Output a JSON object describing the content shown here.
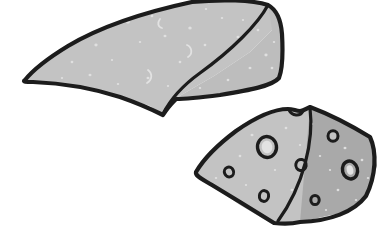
{
  "image": {
    "title": "Two cheese wedges line-art illustration",
    "width": 391,
    "height": 248,
    "background_color": "#ffffff",
    "style": "hand-drawn black outline clipart with flat gray fills and speckle texture"
  },
  "palette": {
    "background": "#ffffff",
    "outline": "#1c1c1c",
    "face_light": "#c3c3c3",
    "face_mid": "#bdbdbd",
    "face_dark": "#a9a9a9",
    "speckle_light": "#e2e2e2",
    "hole_fill": "#cccccc",
    "hole_outline": "#1c1c1c"
  },
  "objects": [
    {
      "id": "cheese-wedge-large",
      "label": "Large cheese wedge (no holes)",
      "faces": [
        {
          "id": "top-slope",
          "label": "Top sloping face",
          "fill": "#c3c3c3",
          "points": "25,80 40,63 68,46 110,26 150,11 192,2 237,0 268,4 277,12 272,30 250,52 214,76 176,98 163,114 150,106 120,96 82,88 48,83"
        },
        {
          "id": "right-face",
          "label": "Right end face",
          "fill": "#bdbdbd",
          "points": "268,4 277,12 281,28 283,50 282,70 277,80 262,86 235,92 205,97 180,99 176,98 214,76 250,52 272,30"
        }
      ],
      "crease": {
        "id": "wedge-crease",
        "label": "Front ridge crease line",
        "path": "M 268,5 C 258,24 232,50 200,73 C 182,86 170,100 163,114"
      },
      "outline_path": "M 25,80 C 33,70 50,57 68,46 C 105,24 150,11 192,2 C 222,-1 252,0 268,5 C 277,10 281,20 282,34 C 283,52 283,68 279,78 C 272,86 250,90 220,95 C 196,98 178,99 176,99 C 170,105 166,110 163,115 C 157,112 143,105 120,97 C 92,88 58,83 33,82 C 26,82 22,82 25,80 Z",
      "speckles": [
        {
          "cx": 128,
          "cy": 22,
          "r": 1.6
        },
        {
          "cx": 152,
          "cy": 16,
          "r": 1.2
        },
        {
          "cx": 165,
          "cy": 36,
          "r": 1.3
        },
        {
          "cx": 140,
          "cy": 42,
          "r": 1.1
        },
        {
          "cx": 96,
          "cy": 45,
          "r": 1.4
        },
        {
          "cx": 72,
          "cy": 62,
          "r": 1.2
        },
        {
          "cx": 90,
          "cy": 75,
          "r": 1.3
        },
        {
          "cx": 112,
          "cy": 60,
          "r": 1.0
        },
        {
          "cx": 190,
          "cy": 28,
          "r": 1.5
        },
        {
          "cx": 205,
          "cy": 45,
          "r": 1.2
        },
        {
          "cx": 222,
          "cy": 18,
          "r": 1.1
        },
        {
          "cx": 238,
          "cy": 37,
          "r": 1.3
        },
        {
          "cx": 180,
          "cy": 62,
          "r": 1.2
        },
        {
          "cx": 148,
          "cy": 78,
          "r": 1.3
        },
        {
          "cx": 118,
          "cy": 84,
          "r": 1.1
        },
        {
          "cx": 62,
          "cy": 78,
          "r": 1.0
        },
        {
          "cx": 258,
          "cy": 30,
          "r": 1.2
        },
        {
          "cx": 266,
          "cy": 55,
          "r": 1.4
        },
        {
          "cx": 274,
          "cy": 42,
          "r": 1.1
        },
        {
          "cx": 250,
          "cy": 68,
          "r": 1.3
        },
        {
          "cx": 228,
          "cy": 80,
          "r": 1.2
        },
        {
          "cx": 200,
          "cy": 88,
          "r": 1.1
        },
        {
          "cx": 243,
          "cy": 20,
          "r": 1.0
        },
        {
          "cx": 272,
          "cy": 68,
          "r": 1.2
        },
        {
          "cx": 206,
          "cy": 9,
          "r": 1.1
        },
        {
          "cx": 168,
          "cy": 86,
          "r": 1.0
        }
      ],
      "squiggles": [
        {
          "id": "squiggle-a",
          "path": "M 160,19 C 157,23 158,27 162,28"
        },
        {
          "id": "squiggle-b",
          "path": "M 187,45 C 192,47 193,54 188,57"
        },
        {
          "id": "squiggle-c",
          "path": "M 148,70 C 153,74 152,80 147,83"
        }
      ]
    },
    {
      "id": "cheese-wedge-holed",
      "label": "Small cheese wedge with holes",
      "faces": [
        {
          "id": "top-face",
          "label": "Top / front face with holes",
          "fill": "#c3c3c3",
          "points": "196,172 206,158 232,134 262,117 286,109 294,112 302,110 310,107 372,138 300,222 272,224 240,205 212,186"
        },
        {
          "id": "right-face",
          "label": "Shaded right cut face",
          "fill": "#a9a9a9",
          "points": "310,107 372,138 377,166 368,194 345,212 300,222"
        }
      ],
      "crease": {
        "id": "holed-wedge-crease",
        "label": "Ridge line from apex to bottom corner",
        "path": "M 310,108 C 314,140 304,185 278,221"
      },
      "outline_path": "M 196,172 C 203,160 216,146 236,131 C 256,117 275,109 288,109 C 293,109 296,111 300,111 C 304,111 307,108 310,107 C 326,113 352,126 370,137 C 377,152 376,176 366,196 C 354,212 330,221 300,222 C 292,224 282,224 274,223 C 258,213 230,196 212,185 C 202,179 195,176 196,172 Z",
      "notch": {
        "id": "top-notch",
        "label": "Small bite notch on top edge",
        "path": "M 289,110 C 292,116 300,117 303,111"
      },
      "holes": [
        {
          "id": "hole-large-left",
          "cx": 267,
          "cy": 147,
          "rx": 9.5,
          "ry": 10.5,
          "rot": -8,
          "face": "top"
        },
        {
          "id": "hole-small-upper-right",
          "cx": 333,
          "cy": 136,
          "rx": 5.0,
          "ry": 5.2,
          "rot": 0,
          "face": "top"
        },
        {
          "id": "hole-small-mid",
          "cx": 301,
          "cy": 165,
          "rx": 5.2,
          "ry": 5.5,
          "rot": 10,
          "face": "top"
        },
        {
          "id": "hole-small-left",
          "cx": 229,
          "cy": 172,
          "rx": 4.6,
          "ry": 5.0,
          "rot": -20,
          "face": "top"
        },
        {
          "id": "hole-small-bottom-left",
          "cx": 264,
          "cy": 196,
          "rx": 4.6,
          "ry": 5.4,
          "rot": 8,
          "face": "top"
        },
        {
          "id": "hole-large-right-face",
          "cx": 350,
          "cy": 170,
          "rx": 7.5,
          "ry": 9.0,
          "rot": -14,
          "face": "right"
        },
        {
          "id": "hole-small-bottom-right-face",
          "cx": 315,
          "cy": 200,
          "rx": 4.2,
          "ry": 4.6,
          "rot": 0,
          "face": "right"
        }
      ],
      "speckles": [
        {
          "cx": 252,
          "cy": 135,
          "r": 1.3
        },
        {
          "cx": 286,
          "cy": 128,
          "r": 1.2
        },
        {
          "cx": 312,
          "cy": 124,
          "r": 1.1
        },
        {
          "cx": 240,
          "cy": 156,
          "r": 1.2
        },
        {
          "cx": 275,
          "cy": 170,
          "r": 1.0
        },
        {
          "cx": 292,
          "cy": 190,
          "r": 1.3
        },
        {
          "cx": 320,
          "cy": 156,
          "r": 1.1
        },
        {
          "cx": 246,
          "cy": 185,
          "r": 1.0
        },
        {
          "cx": 216,
          "cy": 178,
          "r": 1.1
        },
        {
          "cx": 300,
          "cy": 145,
          "r": 1.0
        },
        {
          "cx": 345,
          "cy": 148,
          "r": 1.3
        },
        {
          "cx": 362,
          "cy": 160,
          "r": 1.2
        },
        {
          "cx": 338,
          "cy": 190,
          "r": 1.2
        },
        {
          "cx": 356,
          "cy": 200,
          "r": 1.1
        },
        {
          "cx": 326,
          "cy": 210,
          "r": 1.0
        },
        {
          "cx": 368,
          "cy": 178,
          "r": 1.1
        },
        {
          "cx": 330,
          "cy": 170,
          "r": 1.0
        }
      ]
    }
  ]
}
